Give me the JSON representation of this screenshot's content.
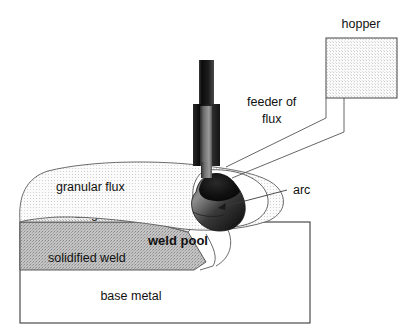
{
  "figure": {
    "background_color": "#ffffff"
  },
  "labels": {
    "hopper": "hopper",
    "feeder_line1": "feeder of",
    "feeder_line2": "flux",
    "granular_flux": "granular flux",
    "slag": "slag",
    "arc": "arc",
    "weld_pool": "weld pool",
    "solidified_weld": "solidified weld",
    "base_metal": "base metal"
  },
  "colors": {
    "outline": "#555555",
    "outline_dark": "#333333",
    "text": "#111111",
    "hopper_fill": "#f2f2f2",
    "granular_flux_fill": "#ebebeb",
    "slag_fill": "#dcdcdc",
    "solidified_weld_fill": "#b4b4b4",
    "base_metal_fill": "#ffffff",
    "electrode_dark": "#141414",
    "weld_pool_dark": "#101010"
  },
  "parts": [
    {
      "name": "hopper",
      "shape": "rectangle",
      "fill": "stippled-light"
    },
    {
      "name": "feeder-of-flux",
      "shape": "tube",
      "fill": "white"
    },
    {
      "name": "electrode",
      "shape": "vertical-bar",
      "fill": "dark-gradient"
    },
    {
      "name": "contact-tip",
      "shape": "sleeve",
      "fill": "dark-gradient"
    },
    {
      "name": "granular-flux",
      "shape": "mound",
      "fill": "stippled-light"
    },
    {
      "name": "slag",
      "shape": "layer",
      "fill": "stippled-medium"
    },
    {
      "name": "solidified-weld",
      "shape": "layer",
      "fill": "stippled-dark"
    },
    {
      "name": "arc-cavity",
      "shape": "rounded-blob",
      "fill": "white"
    },
    {
      "name": "weld-pool",
      "shape": "blob",
      "fill": "dark-gradient"
    },
    {
      "name": "base-metal",
      "shape": "rectangle",
      "fill": "white"
    }
  ]
}
